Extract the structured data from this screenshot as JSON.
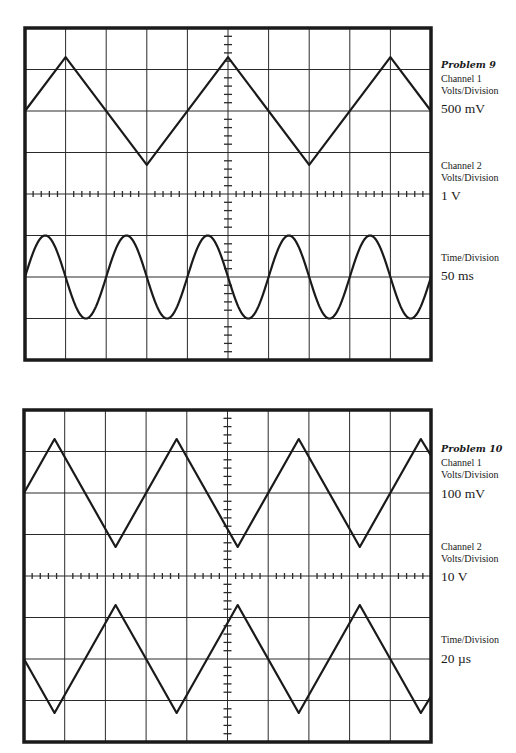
{
  "colors": {
    "background": "#ffffff",
    "ink": "#1a1a1a",
    "grid": "#2a2a2a"
  },
  "scope_grid": {
    "divisions_x": 10,
    "divisions_y": 8,
    "minor_ticks_per_division": 5
  },
  "problems": [
    {
      "title": "Problem 9",
      "channel1": {
        "label": "Channel 1",
        "unit_label": "Volts/Division",
        "value": "500 mV"
      },
      "channel2": {
        "label": "Channel 2",
        "unit_label": "Volts/Division",
        "value": "1 V"
      },
      "time": {
        "unit_label": "Time/Division",
        "value": "50 ms"
      }
    },
    {
      "title": "Problem 10",
      "channel1": {
        "label": "Channel 1",
        "unit_label": "Volts/Division",
        "value": "100 mV"
      },
      "channel2": {
        "label": "Channel 2",
        "unit_label": "Volts/Division",
        "value": "10 V"
      },
      "time": {
        "unit_label": "Time/Division",
        "value": "20 µs"
      }
    }
  ],
  "chart_data": [
    {
      "type": "line",
      "title": "Problem 9 oscilloscope display",
      "xlabel": "Time (divisions)",
      "ylabel": "Vertical (divisions)",
      "xlim": [
        0,
        10
      ],
      "ylim": [
        -4,
        4
      ],
      "grid": true,
      "series": [
        {
          "name": "Channel 1",
          "shape": "triangle",
          "center_div": 2,
          "amplitude_div": 1.3,
          "period_div": 4,
          "first_peak_div": 1,
          "points": [
            [
              0,
              2
            ],
            [
              1,
              3.3
            ],
            [
              3,
              0.7
            ],
            [
              5,
              3.3
            ],
            [
              7,
              0.7
            ],
            [
              9,
              3.3
            ],
            [
              10,
              2
            ]
          ]
        },
        {
          "name": "Channel 2",
          "shape": "sine",
          "center_div": -2,
          "amplitude_div": 1.0,
          "period_div": 2,
          "first_peak_div": 0.5
        }
      ]
    },
    {
      "type": "line",
      "title": "Problem 10 oscilloscope display",
      "xlabel": "Time (divisions)",
      "ylabel": "Vertical (divisions)",
      "xlim": [
        0,
        10
      ],
      "ylim": [
        -4,
        4
      ],
      "grid": true,
      "series": [
        {
          "name": "Channel 1",
          "shape": "triangle",
          "center_div": 2,
          "amplitude_div": 1.3,
          "period_div": 3,
          "first_peak_div": 0.75,
          "points": [
            [
              0,
              2
            ],
            [
              0.75,
              3.3
            ],
            [
              2.25,
              0.7
            ],
            [
              3.75,
              3.3
            ],
            [
              5.25,
              0.7
            ],
            [
              6.75,
              3.3
            ],
            [
              8.25,
              0.7
            ],
            [
              9.75,
              3.3
            ],
            [
              10,
              2.9
            ]
          ]
        },
        {
          "name": "Channel 2",
          "shape": "triangle",
          "center_div": -2,
          "amplitude_div": 1.3,
          "period_div": 3,
          "first_peak_div": 2.25,
          "points": [
            [
              0,
              -2
            ],
            [
              0.75,
              -3.3
            ],
            [
              2.25,
              -0.7
            ],
            [
              3.75,
              -3.3
            ],
            [
              5.25,
              -0.7
            ],
            [
              6.75,
              -3.3
            ],
            [
              8.25,
              -0.7
            ],
            [
              9.75,
              -3.3
            ],
            [
              10,
              -2.9
            ]
          ]
        }
      ]
    }
  ]
}
